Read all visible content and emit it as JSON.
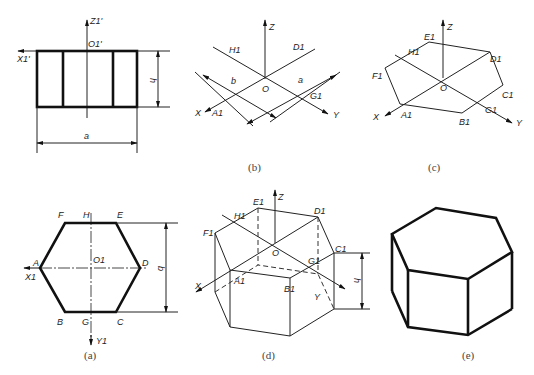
{
  "figure": {
    "panels": [
      {
        "id": "a",
        "caption": "(a)",
        "description": "Top view of regular hexagon",
        "vertex_labels": {
          "A": "A",
          "B": "B",
          "C": "C",
          "D": "D",
          "E": "E",
          "F": "F",
          "G": "G",
          "H": "H"
        },
        "origin_label": "O1",
        "axis_labels": {
          "x": "X1",
          "y": "Y1"
        },
        "dimension_label": "b"
      },
      {
        "id": "front",
        "caption": "",
        "description": "Front view of hexagonal prism",
        "origin_label": "O1'",
        "axis_labels": {
          "x": "X1'",
          "z": "Z1'"
        },
        "dimension_labels": {
          "height": "h",
          "width": "a"
        }
      },
      {
        "id": "b",
        "caption": "(b)",
        "description": "Isometric axes with points A1, D1, G1, H1",
        "origin_label": "O",
        "axis_labels": {
          "x": "X",
          "y": "Y",
          "z": "Z"
        },
        "point_labels": [
          "A1",
          "D1",
          "G1",
          "H1"
        ],
        "dimension_labels": [
          "b",
          "a"
        ]
      },
      {
        "id": "c",
        "caption": "(c)",
        "description": "Isometric top hexagon",
        "origin_label": "O",
        "axis_labels": {
          "x": "X",
          "y": "Y",
          "z": "Z"
        },
        "point_labels": [
          "A1",
          "B1",
          "C1",
          "D1",
          "E1",
          "F1",
          "G1",
          "H1"
        ]
      },
      {
        "id": "d",
        "caption": "(d)",
        "description": "Isometric prism construction with hidden lines",
        "origin_label": "O",
        "axis_labels": {
          "x": "X",
          "y": "Y",
          "z": "Z"
        },
        "point_labels": [
          "A1",
          "B1",
          "C1",
          "D1",
          "E1",
          "F1",
          "G1",
          "H1"
        ],
        "dimension_label": "h"
      },
      {
        "id": "e",
        "caption": "(e)",
        "description": "Finished isometric hexagonal prism"
      }
    ]
  },
  "labels": {
    "front": {
      "z": "Z1'",
      "o": "O1'",
      "x": "X1'",
      "h": "h",
      "a": "a"
    },
    "a": {
      "F": "F",
      "H": "H",
      "E": "E",
      "A": "A",
      "O": "O1",
      "D": "D",
      "X": "X1",
      "B": "B",
      "G": "G",
      "C": "C",
      "Y": "Y1",
      "b": "b",
      "cap": "(a)"
    },
    "b": {
      "Z": "Z",
      "H": "H1",
      "D": "D1",
      "b": "b",
      "a": "a",
      "O": "O",
      "G": "G1",
      "X": "X",
      "A": "A1",
      "Y": "Y",
      "cap": "(b)"
    },
    "c": {
      "Z": "Z",
      "E": "E1",
      "H": "H1",
      "D": "D1",
      "F": "F1",
      "O": "O",
      "C": "C1",
      "G": "G1",
      "X": "X",
      "A": "A1",
      "B": "B1",
      "Y": "Y",
      "cap": "(c)"
    },
    "d": {
      "Z": "Z",
      "E": "E1",
      "H": "H1",
      "D": "D1",
      "F": "F1",
      "O": "O",
      "C": "C1",
      "G": "G1",
      "X": "X",
      "A": "A1",
      "B": "B1",
      "Y": "Y",
      "h": "h",
      "cap": "(d)"
    },
    "e": {
      "cap": "(e)"
    }
  },
  "colors": {
    "line": "#111111",
    "background": "#ffffff",
    "caption": "#444444"
  }
}
